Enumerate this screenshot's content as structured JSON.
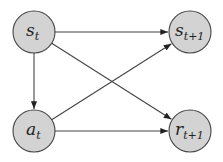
{
  "diagram": {
    "type": "directed-graph",
    "colors": {
      "node_fill": "#d3d3d3",
      "node_stroke": "#444444",
      "edge": "#444444",
      "text": "#222222",
      "background": "#ffffff"
    },
    "nodes": [
      {
        "id": "s_t",
        "base": "s",
        "sub": "t",
        "cx": 34,
        "cy": 32,
        "r": 21
      },
      {
        "id": "s_t1",
        "base": "s",
        "sub": "t+1",
        "cx": 190,
        "cy": 32,
        "r": 21
      },
      {
        "id": "a_t",
        "base": "a",
        "sub": "t",
        "cx": 34,
        "cy": 131,
        "r": 21
      },
      {
        "id": "r_t1",
        "base": "r",
        "sub": "t+1",
        "cx": 190,
        "cy": 131,
        "r": 21
      }
    ],
    "edges": [
      {
        "from": "s_t",
        "to": "s_t1"
      },
      {
        "from": "s_t",
        "to": "r_t1"
      },
      {
        "from": "s_t",
        "to": "a_t"
      },
      {
        "from": "a_t",
        "to": "s_t1"
      },
      {
        "from": "a_t",
        "to": "r_t1"
      }
    ]
  }
}
